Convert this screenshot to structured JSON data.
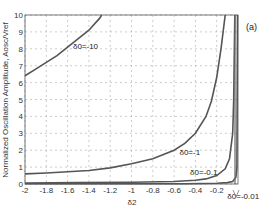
{
  "chart_data": {
    "type": "line",
    "title": "",
    "panel_label": "(a)",
    "xlabel": "δ2",
    "ylabel": "Normalized Oscillation Amplitude, Aosc/Vref",
    "xlim": [
      -2,
      0
    ],
    "ylim": [
      0,
      10
    ],
    "xticks": [
      -2,
      -1.8,
      -1.6,
      -1.4,
      -1.2,
      -1,
      -0.8,
      -0.6,
      -0.4,
      -0.2
    ],
    "xtick_labels": [
      "-2",
      "-1.8",
      "-1.6",
      "-1.4",
      "-1.2",
      "-1",
      "-0.8",
      "-0.6",
      "-0.4",
      "-0.2"
    ],
    "yticks": [
      0,
      1,
      2,
      3,
      4,
      5,
      6,
      7,
      8,
      9,
      10
    ],
    "ytick_labels": [
      "0",
      "1",
      "2",
      "3",
      "4",
      "5",
      "6",
      "7",
      "8",
      "9",
      "10"
    ],
    "grid": true,
    "series": [
      {
        "name": "δ0=-10",
        "label": "δ0=-10",
        "x": [
          -2,
          -1.9,
          -1.8,
          -1.7,
          -1.6,
          -1.5,
          -1.4,
          -1.3,
          -1.28
        ],
        "y": [
          6.4,
          6.8,
          7.2,
          7.6,
          8.1,
          8.6,
          9.1,
          9.8,
          10
        ]
      },
      {
        "name": "δ0=-1",
        "label": "δ0=-1",
        "x": [
          -2,
          -1.8,
          -1.6,
          -1.4,
          -1.2,
          -1,
          -0.8,
          -0.6,
          -0.5,
          -0.4,
          -0.3,
          -0.25,
          -0.2,
          -0.16,
          -0.12
        ],
        "y": [
          0.6,
          0.65,
          0.72,
          0.8,
          0.95,
          1.2,
          1.5,
          2.0,
          2.4,
          3.0,
          4.0,
          4.9,
          6.3,
          8.0,
          10
        ]
      },
      {
        "name": "δ0=-0.1",
        "label": "δ0=-0.1",
        "x": [
          -2,
          -1.5,
          -1,
          -0.6,
          -0.4,
          -0.3,
          -0.2,
          -0.12,
          -0.08,
          -0.05,
          -0.04,
          -0.03
        ],
        "y": [
          0.06,
          0.08,
          0.1,
          0.15,
          0.22,
          0.3,
          0.5,
          0.9,
          1.5,
          3.0,
          5.0,
          10
        ]
      },
      {
        "name": "δ0=-0.01",
        "label": "δ0=-0.01",
        "x": [
          -2,
          -1,
          -0.5,
          -0.2,
          -0.1,
          -0.05,
          -0.02,
          -0.01,
          -0.005
        ],
        "y": [
          0.01,
          0.01,
          0.02,
          0.04,
          0.08,
          0.15,
          0.4,
          1.0,
          10
        ]
      }
    ],
    "annotations": [
      {
        "text": "δ0=-10",
        "x": -1.55,
        "y": 8.0
      },
      {
        "text": "δ0=-1",
        "x": -0.55,
        "y": 1.7
      },
      {
        "text": "δ0=-0.1",
        "x": -0.45,
        "y": 0.55
      },
      {
        "text": "δ0=-0.01",
        "x": -0.1,
        "y": -0.9
      }
    ],
    "legend": null
  }
}
